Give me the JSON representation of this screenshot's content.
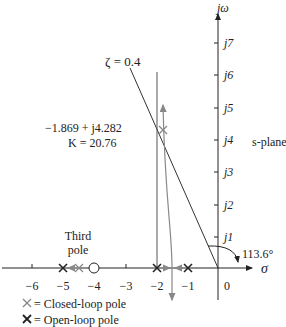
{
  "axes": {
    "imag_label": "jω",
    "real_label": "σ",
    "plane_label": "s-plane",
    "imag_ticks": [
      "j1",
      "j2",
      "j3",
      "j4",
      "j5",
      "j6",
      "j7"
    ],
    "real_ticks": [
      "−6",
      "−5",
      "−4",
      "−3",
      "−2",
      "−1",
      "0"
    ]
  },
  "annotations": {
    "zeta_line": "ζ = 0.4",
    "point": "−1.869 + j4.282",
    "gain": "K = 20.76",
    "angle": "113.6°",
    "third_pole_line1": "Third",
    "third_pole_line2": "pole"
  },
  "legend": {
    "closed_loop": "= Closed-loop pole",
    "open_loop": "= Open-loop pole"
  },
  "colors": {
    "line": "#333333",
    "gray": "#888888"
  }
}
